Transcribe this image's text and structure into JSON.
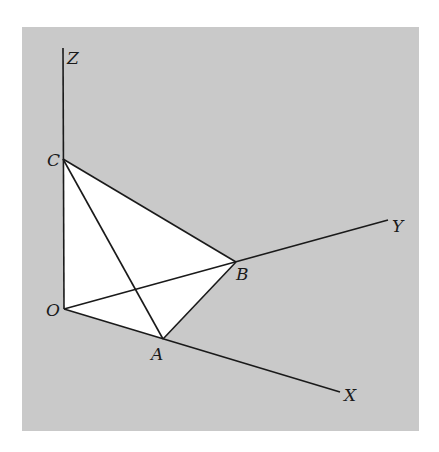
{
  "figure": {
    "background_color": "#c9c9c9",
    "fill_color": "#ffffff",
    "line_color": "#1a1a1a",
    "panel": {
      "x": 22,
      "y": 27,
      "width": 397,
      "height": 404
    }
  },
  "points": {
    "O": {
      "label": "O",
      "x": 64,
      "y": 309
    },
    "A": {
      "label": "A",
      "x": 163,
      "y": 339
    },
    "B": {
      "label": "B",
      "x": 236,
      "y": 262
    },
    "C": {
      "label": "C",
      "x": 63,
      "y": 159
    }
  },
  "axes": {
    "X": {
      "label": "X",
      "end_x": 340,
      "end_y": 392
    },
    "Y": {
      "label": "Y",
      "end_x": 388,
      "end_y": 220
    },
    "Z": {
      "label": "Z",
      "end_x": 63,
      "end_y": 48
    }
  },
  "labels": {
    "O": "O",
    "A": "A",
    "B": "B",
    "C": "C",
    "X": "X",
    "Y": "Y",
    "Z": "Z"
  }
}
